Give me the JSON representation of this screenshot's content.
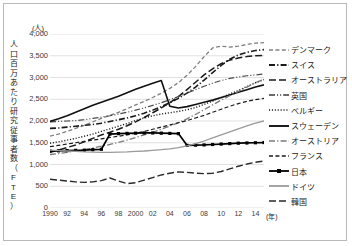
{
  "axes": {
    "y_unit": "(人)",
    "y_title": "人口百万あたり研究従事者数（FTE）",
    "y_title_chars": [
      "人",
      "口",
      "百",
      "万",
      "あ",
      "た",
      "り",
      "研",
      "究",
      "従",
      "事",
      "者",
      "数",
      "（",
      "F",
      "T",
      "E",
      "）"
    ],
    "x_unit": "(年)"
  },
  "chart_data": {
    "type": "line",
    "title": "",
    "xlabel": "(年)",
    "ylabel": "人口百万あたり研究従事者数（FTE）",
    "ylim": [
      0,
      4000
    ],
    "ytick_labels": [
      "4,000",
      "3,500",
      "3,000",
      "2,500",
      "2,000",
      "1,500",
      "1,000",
      "500",
      "0"
    ],
    "ytick_values": [
      4000,
      3500,
      3000,
      2500,
      2000,
      1500,
      1000,
      500,
      0
    ],
    "grid": true,
    "legend_position": "right",
    "x": [
      1990,
      1991,
      1992,
      1993,
      1994,
      1995,
      1996,
      1997,
      1998,
      1999,
      2000,
      2001,
      2002,
      2003,
      2004,
      2005,
      2006,
      2007,
      2008,
      2009,
      2010,
      2011,
      2012,
      2013,
      2014,
      2015
    ],
    "xtick_labels": [
      "1990",
      "92",
      "94",
      "96",
      "98",
      "2000",
      "02",
      "04",
      "06",
      "08",
      "10",
      "12",
      "14"
    ],
    "xtick_values": [
      1990,
      1992,
      1994,
      1996,
      1998,
      2000,
      2002,
      2004,
      2006,
      2008,
      2010,
      2012,
      2014
    ],
    "series": [
      {
        "name": "デンマーク",
        "style": "dashed",
        "marker": "none",
        "width": 1.3,
        "color": "#808080",
        "values": [
          1650,
          1700,
          1760,
          1830,
          1900,
          1980,
          2060,
          2130,
          2200,
          2280,
          2370,
          2450,
          2540,
          2640,
          2750,
          2880,
          3050,
          3250,
          3480,
          3680,
          3720,
          3700,
          3720,
          3760,
          3790,
          3800
        ]
      },
      {
        "name": "スイス",
        "style": "dashdot",
        "marker": "none",
        "width": 1.6,
        "color": "#1a1a1a",
        "values": [
          1830,
          1840,
          1860,
          1880,
          1900,
          1920,
          1950,
          1990,
          2030,
          2070,
          2120,
          2180,
          2250,
          2330,
          2420,
          2520,
          2640,
          2780,
          2940,
          3110,
          3280,
          3420,
          3520,
          3580,
          3620,
          3640
        ]
      },
      {
        "name": "オーストラリア",
        "style": "longdash",
        "marker": "none",
        "width": 1.5,
        "color": "#1a1a1a",
        "values": [
          1280,
          1330,
          1390,
          1450,
          1520,
          1600,
          1680,
          1740,
          1810,
          1890,
          1980,
          2080,
          2190,
          2300,
          2420,
          2560,
          2720,
          2890,
          3060,
          3200,
          3320,
          3400,
          3450,
          3480,
          3500,
          3510
        ]
      },
      {
        "name": "英国",
        "style": "dashdotdot",
        "marker": "none",
        "width": 1.2,
        "color": "#4a4a4a",
        "values": [
          1980,
          1990,
          2000,
          2010,
          2030,
          2060,
          2090,
          2120,
          2160,
          2200,
          2250,
          2300,
          2360,
          2420,
          2490,
          2560,
          2640,
          2720,
          2800,
          2870,
          2930,
          2980,
          3010,
          3040,
          3060,
          3080
        ]
      },
      {
        "name": "ベルギー",
        "style": "dotted",
        "marker": "none",
        "width": 1.4,
        "color": "#1a1a1a",
        "values": [
          1490,
          1520,
          1560,
          1600,
          1650,
          1700,
          1760,
          1820,
          1880,
          1940,
          2010,
          2070,
          2120,
          2160,
          2190,
          2220,
          2260,
          2310,
          2380,
          2460,
          2540,
          2620,
          2700,
          2790,
          2880,
          2950
        ]
      },
      {
        "name": "スウェーデン",
        "style": "solid",
        "marker": "none",
        "width": 1.6,
        "color": "#111111",
        "values": [
          1990,
          2050,
          2120,
          2200,
          2280,
          2360,
          2430,
          2500,
          2570,
          2650,
          2730,
          2800,
          2870,
          2930,
          2340,
          2300,
          2330,
          2380,
          2430,
          2480,
          2540,
          2600,
          2660,
          2720,
          2780,
          2830
        ]
      },
      {
        "name": "オーストリア",
        "style": "dashdot",
        "marker": "none",
        "width": 1.3,
        "color": "#7a7a7a",
        "values": [
          1230,
          1250,
          1280,
          1310,
          1340,
          1380,
          1420,
          1460,
          1510,
          1560,
          1620,
          1680,
          1740,
          1810,
          1880,
          1960,
          2050,
          2150,
          2260,
          2370,
          2480,
          2580,
          2680,
          2780,
          2880,
          2960
        ]
      },
      {
        "name": "フランス",
        "style": "dashed",
        "marker": "none",
        "width": 1.2,
        "color": "#1a1a1a",
        "values": [
          1410,
          1440,
          1470,
          1500,
          1530,
          1560,
          1590,
          1620,
          1650,
          1680,
          1720,
          1760,
          1810,
          1860,
          1910,
          1960,
          2010,
          2070,
          2130,
          2200,
          2270,
          2340,
          2400,
          2450,
          2490,
          2520
        ]
      },
      {
        "name": "日本",
        "style": "solid",
        "marker": "square",
        "width": 1.7,
        "color": "#000000",
        "values": [
          1310,
          1315,
          1320,
          1325,
          1330,
          1340,
          1350,
          1700,
          1710,
          1715,
          1720,
          1725,
          1725,
          1720,
          1715,
          1710,
          1440,
          1445,
          1450,
          1460,
          1470,
          1480,
          1490,
          1495,
          1500,
          1505
        ]
      },
      {
        "name": "ドイツ",
        "style": "solid",
        "marker": "none",
        "width": 1.3,
        "color": "#9a9a9a",
        "values": [
          1330,
          1320,
          1310,
          1300,
          1290,
          1285,
          1280,
          1280,
          1285,
          1290,
          1300,
          1310,
          1325,
          1340,
          1360,
          1390,
          1430,
          1480,
          1540,
          1610,
          1680,
          1750,
          1820,
          1890,
          1950,
          2000
        ]
      },
      {
        "name": "韓国",
        "style": "longdash",
        "marker": "none",
        "width": 1.4,
        "color": "#2a2a2a",
        "values": [
          660,
          640,
          620,
          600,
          590,
          600,
          630,
          690,
          620,
          560,
          580,
          640,
          700,
          760,
          800,
          830,
          820,
          800,
          790,
          800,
          840,
          900,
          960,
          1010,
          1050,
          1080
        ]
      }
    ]
  },
  "legend": {
    "items": [
      {
        "label": "デンマーク",
        "style": "dashed",
        "marker": "none",
        "color": "#808080",
        "width": 1.3
      },
      {
        "label": "スイス",
        "style": "dashdot",
        "marker": "none",
        "color": "#1a1a1a",
        "width": 1.8
      },
      {
        "label": "オーストラリア",
        "style": "longdash",
        "marker": "none",
        "color": "#1a1a1a",
        "width": 1.6
      },
      {
        "label": "英国",
        "style": "dashdotdot",
        "marker": "none",
        "color": "#3a3a3a",
        "width": 1.6
      },
      {
        "label": "ベルギー",
        "style": "dotted",
        "marker": "none",
        "color": "#1a1a1a",
        "width": 1.6
      },
      {
        "label": "スウェーデン",
        "style": "solid",
        "marker": "none",
        "color": "#111111",
        "width": 1.9
      },
      {
        "label": "オーストリア",
        "style": "dashdot",
        "marker": "none",
        "color": "#7a7a7a",
        "width": 1.6
      },
      {
        "label": "フランス",
        "style": "dashed",
        "marker": "none",
        "color": "#1a1a1a",
        "width": 1.6
      },
      {
        "label": "日本",
        "style": "solid",
        "marker": "square",
        "color": "#000000",
        "width": 1.8
      },
      {
        "label": "ドイツ",
        "style": "solid",
        "marker": "none",
        "color": "#9a9a9a",
        "width": 1.8
      },
      {
        "label": "韓国",
        "style": "longdash",
        "marker": "none",
        "color": "#2a2a2a",
        "width": 1.7
      }
    ]
  }
}
